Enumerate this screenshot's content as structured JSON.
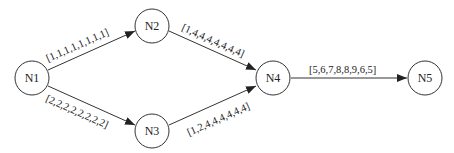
{
  "diagram": {
    "nodes": [
      {
        "id": "N1",
        "label": "N1",
        "cx": 32,
        "cy": 78
      },
      {
        "id": "N2",
        "label": "N2",
        "cx": 152,
        "cy": 26
      },
      {
        "id": "N3",
        "label": "N3",
        "cx": 152,
        "cy": 131
      },
      {
        "id": "N4",
        "label": "N4",
        "cx": 273,
        "cy": 78
      },
      {
        "id": "N5",
        "label": "N5",
        "cx": 425,
        "cy": 78
      }
    ],
    "edges": [
      {
        "from": "N1",
        "to": "N2",
        "label": "[1,1,1,1,1,1,1,1]"
      },
      {
        "from": "N1",
        "to": "N3",
        "label": "[2,2,2,2,2,2,2,2]"
      },
      {
        "from": "N2",
        "to": "N4",
        "label": "[1,4,4,4,4,4,4,4]"
      },
      {
        "from": "N3",
        "to": "N4",
        "label": "[1,2,4,4,4,4,4,4]"
      },
      {
        "from": "N4",
        "to": "N5",
        "label": "[5,6,7,8,8,9,6,5]"
      }
    ],
    "colors": {
      "stroke": "#333333",
      "text": "#222222",
      "background": "#ffffff"
    }
  }
}
